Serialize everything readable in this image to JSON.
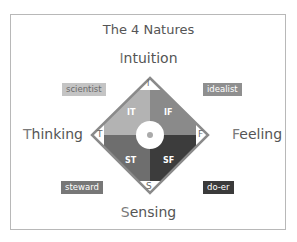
{
  "title": "The 4 Natures",
  "axes": {
    "top": {
      "first": "I",
      "rest": "ntuition"
    },
    "left": {
      "first": "T",
      "rest": "hinking"
    },
    "right": {
      "first": "F",
      "rest": "eeling"
    },
    "bottom": {
      "first": "S",
      "rest": "ensing"
    }
  },
  "quadrants": [
    {
      "label": "IT",
      "color": "#b3b3b3"
    },
    {
      "label": "IF",
      "color": "#8a8a8a"
    },
    {
      "label": "ST",
      "color": "#6e6e6e"
    },
    {
      "label": "SF",
      "color": "#3c3c3c"
    }
  ],
  "corner_letters": {
    "top": "I",
    "left": "T",
    "right": "F",
    "bottom": "S"
  },
  "badges": {
    "scientist": {
      "label": "scientist",
      "color": "#c4c4c4",
      "text": "#6a6a6a"
    },
    "idealist": {
      "label": "idealist",
      "color": "#8f8f8f",
      "text": "#ffffff"
    },
    "steward": {
      "label": "steward",
      "color": "#777777",
      "text": "#ffffff"
    },
    "doer": {
      "label": "do-er",
      "color": "#3a3a3a",
      "text": "#ffffff"
    }
  },
  "colors": {
    "border": "#8a8a8a",
    "text": "#555555"
  }
}
